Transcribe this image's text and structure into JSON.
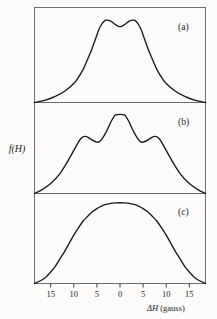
{
  "figure": {
    "title": "",
    "ylabel": "f(H)",
    "xlabel_symbol": "ΔH",
    "xlabel_units": "(gauss)",
    "background_color": "#fdfcfa",
    "curve_color": "#1a1a1a",
    "frame_color": "#6e6e6e"
  },
  "axis": {
    "xticks": [
      "15",
      "10",
      "5",
      "0",
      "5",
      "10",
      "15"
    ],
    "xtick_values": [
      -15,
      -10,
      -5,
      0,
      5,
      10,
      15
    ],
    "xlim": [
      -18.5,
      18.5
    ],
    "grid": false
  },
  "panels": [
    {
      "label": "(a)"
    },
    {
      "label": "(b)"
    },
    {
      "label": "(c)"
    }
  ],
  "chart_data": {
    "type": "line",
    "title": "",
    "xlabel": "ΔH (gauss)",
    "ylabel": "f(H)",
    "xlim": [
      -18.5,
      18.5
    ],
    "ylim": [
      0,
      1.05
    ],
    "grid": false,
    "legend": "none",
    "panels": [
      {
        "label": "(a)",
        "description": "doublet lineshape: two maxima with shallow central minimum",
        "x": [
          -18.5,
          -16,
          -14,
          -12,
          -10,
          -9,
          -8,
          -7,
          -6,
          -5,
          -4.5,
          -4,
          -3.5,
          -3,
          -2,
          -1,
          0,
          1,
          2,
          3,
          3.5,
          4,
          4.5,
          5,
          6,
          7,
          8,
          9,
          10,
          12,
          14,
          16,
          18.5
        ],
        "y": [
          0.0,
          0.03,
          0.07,
          0.13,
          0.22,
          0.29,
          0.38,
          0.5,
          0.63,
          0.78,
          0.85,
          0.9,
          0.935,
          0.95,
          0.94,
          0.9,
          0.875,
          0.9,
          0.94,
          0.95,
          0.935,
          0.9,
          0.85,
          0.78,
          0.63,
          0.5,
          0.38,
          0.29,
          0.22,
          0.13,
          0.07,
          0.03,
          0.0
        ]
      },
      {
        "label": "(b)",
        "description": "triplet lineshape: tall central peak flanked by two lower side peaks",
        "x": [
          -18.5,
          -17,
          -15,
          -13,
          -11,
          -10,
          -9,
          -8.5,
          -8,
          -7.5,
          -7,
          -6,
          -5,
          -4.5,
          -4,
          -3,
          -2,
          -1.5,
          -1,
          0,
          1,
          1.5,
          2,
          3,
          4,
          4.5,
          5,
          6,
          7,
          7.5,
          8,
          8.5,
          9,
          10,
          11,
          13,
          15,
          17,
          18.5
        ],
        "y": [
          0.0,
          0.04,
          0.12,
          0.24,
          0.42,
          0.52,
          0.62,
          0.66,
          0.685,
          0.69,
          0.68,
          0.645,
          0.62,
          0.625,
          0.65,
          0.74,
          0.86,
          0.91,
          0.945,
          0.955,
          0.945,
          0.91,
          0.86,
          0.74,
          0.65,
          0.625,
          0.62,
          0.645,
          0.68,
          0.69,
          0.685,
          0.66,
          0.62,
          0.52,
          0.42,
          0.24,
          0.12,
          0.04,
          0.0
        ]
      },
      {
        "label": "(c)",
        "description": "single broad flat-topped singlet lineshape",
        "x": [
          -18.5,
          -17,
          -16,
          -15,
          -14,
          -13,
          -12,
          -11,
          -10,
          -9,
          -8,
          -7,
          -6,
          -5,
          -4,
          -3,
          -2,
          -1,
          0,
          1,
          2,
          3,
          4,
          5,
          6,
          7,
          8,
          9,
          10,
          11,
          12,
          13,
          14,
          15,
          16,
          17,
          18.5
        ],
        "y": [
          0.0,
          0.04,
          0.08,
          0.14,
          0.21,
          0.3,
          0.39,
          0.49,
          0.59,
          0.68,
          0.76,
          0.82,
          0.875,
          0.915,
          0.945,
          0.965,
          0.978,
          0.984,
          0.986,
          0.984,
          0.978,
          0.965,
          0.945,
          0.915,
          0.875,
          0.82,
          0.76,
          0.68,
          0.59,
          0.49,
          0.39,
          0.3,
          0.21,
          0.14,
          0.08,
          0.04,
          0.0
        ]
      }
    ]
  }
}
